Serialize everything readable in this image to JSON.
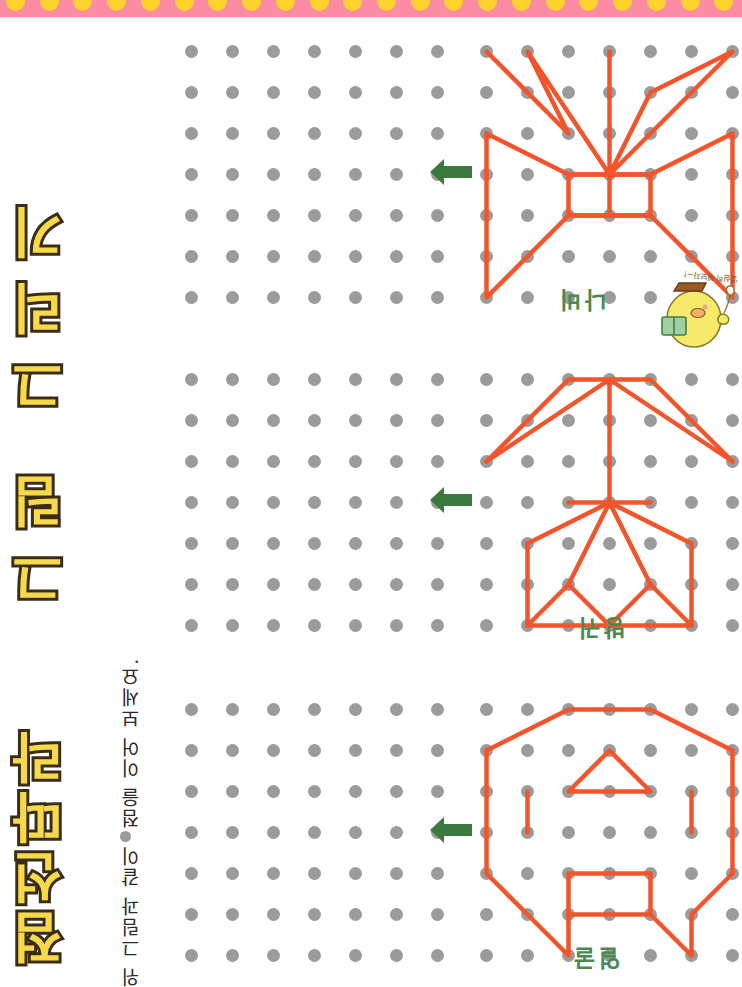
{
  "page": {
    "title_line1": "점선따라",
    "title_line2": "그림 그리기",
    "instruction": "위 그림과 같이 ● 점을 이어 보세요.",
    "instruction_prefix": "위 그림과 같이",
    "instruction_suffix": "점을 이어 보세요.",
    "background_color": "#ffffff"
  },
  "decor": {
    "strip_color": "#fb8ca4",
    "scallop_color": "#ffd22e",
    "scallop_count": 22
  },
  "colors": {
    "dot": "#9b9b9b",
    "line": "#f2552b",
    "arrow": "#3a7a3e",
    "label": "#4a8a52",
    "title_fill": "#f8d94a",
    "title_stroke": "#3a2d18"
  },
  "grid": {
    "rows": 7,
    "cols": 7,
    "spacing": 41,
    "dot_size": 13
  },
  "mascot": {
    "name": "chick-mascot",
    "speech": "열심히 해보자~!"
  },
  "exercises": [
    {
      "id": "exercise-1",
      "label": "나비",
      "arrow": "left-arrow",
      "shape_name": "butterfly",
      "paths": [
        "0,0 2,2 1,0 3,3 3,0 3,3 4,1 6,0 3,3",
        "0,2 0,6 2,4 4,4 6,6 6,2 4,3 2,3 0,2",
        "2,3 2,4 4,4 4,3 2,3",
        "3,3 3,4"
      ]
    },
    {
      "id": "exercise-2",
      "label": "방귀",
      "arrow": "left-arrow",
      "shape_name": "tree-arrow",
      "paths": [
        "0,2 2,0 3,0 4,0 6,2",
        "0,2 3,0 6,2",
        "3,0 3,3",
        "2,3 4,3",
        "1,4 1,6 3,6 5,6 5,4",
        "3,3 1,4",
        "3,3 5,4",
        "1,6 2,5 3,6 4,5 5,6",
        "3,3 2,5",
        "3,3 4,5"
      ]
    },
    {
      "id": "exercise-3",
      "label": "얼굴",
      "arrow": "left-arrow",
      "shape_name": "animal-face",
      "paths": [
        "2,0 4,0 6,1 6,4 5,5 5,6 4,5 2,5 2,6 1,5 0,4 0,1 2,0",
        "3,1 4,2 2,2 3,1",
        "1,2 1,3",
        "5,2 5,3",
        "2,4 2,5",
        "4,4 4,5",
        "2,4 4,4"
      ]
    }
  ]
}
